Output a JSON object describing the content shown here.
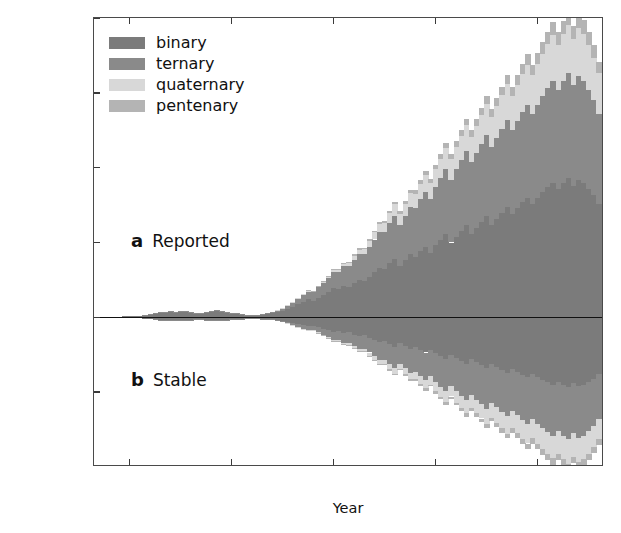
{
  "chart_data": {
    "type": "bar",
    "title": "",
    "xlabel": "Year",
    "ylabel": "# of Structures Discovered in Year",
    "xlim": [
      1913,
      2013
    ],
    "ylim": [
      -1000,
      2000
    ],
    "y_tick_labels": [
      "2000.0",
      "1500.0",
      "1000.0",
      "500.0",
      "0.0",
      "500.0",
      "1000.0"
    ],
    "y_tick_values": [
      2000,
      1500,
      1000,
      500,
      0,
      -500,
      -1000
    ],
    "x_tick_labels": [
      "1920",
      "1940",
      "1960",
      "1980",
      "2000"
    ],
    "x_tick_values": [
      1920,
      1940,
      1960,
      1980,
      2000
    ],
    "grid": false,
    "legend_position": "upper left",
    "stacked": true,
    "mirrored": true,
    "panels": [
      {
        "key": "a",
        "letter": "a",
        "label": "Reported",
        "direction": "up"
      },
      {
        "key": "b",
        "letter": "b",
        "label": "Stable",
        "direction": "down"
      }
    ],
    "legend": [
      {
        "name": "binary",
        "color": "#7b7b7b"
      },
      {
        "name": "ternary",
        "color": "#8a8a8a"
      },
      {
        "name": "quaternary",
        "color": "#d8d8d8"
      },
      {
        "name": "pentenary",
        "color": "#b4b4b4"
      }
    ],
    "series_order": [
      "pentenary",
      "quaternary",
      "ternary",
      "binary"
    ],
    "x": [
      1913,
      1914,
      1915,
      1916,
      1917,
      1918,
      1919,
      1920,
      1921,
      1922,
      1923,
      1924,
      1925,
      1926,
      1927,
      1928,
      1929,
      1930,
      1931,
      1932,
      1933,
      1934,
      1935,
      1936,
      1937,
      1938,
      1939,
      1940,
      1941,
      1942,
      1943,
      1944,
      1945,
      1946,
      1947,
      1948,
      1949,
      1950,
      1951,
      1952,
      1953,
      1954,
      1955,
      1956,
      1957,
      1958,
      1959,
      1960,
      1961,
      1962,
      1963,
      1964,
      1965,
      1966,
      1967,
      1968,
      1969,
      1970,
      1971,
      1972,
      1973,
      1974,
      1975,
      1976,
      1977,
      1978,
      1979,
      1980,
      1981,
      1982,
      1983,
      1984,
      1985,
      1986,
      1987,
      1988,
      1989,
      1990,
      1991,
      1992,
      1993,
      1994,
      1995,
      1996,
      1997,
      1998,
      1999,
      2000,
      2001,
      2002,
      2003,
      2004,
      2005,
      2006,
      2007,
      2008,
      2009,
      2010,
      2011,
      2012
    ],
    "reported": {
      "binary": [
        2,
        3,
        4,
        5,
        4,
        3,
        6,
        8,
        10,
        12,
        16,
        20,
        26,
        34,
        30,
        38,
        34,
        40,
        36,
        32,
        28,
        24,
        30,
        34,
        40,
        36,
        30,
        26,
        22,
        18,
        14,
        10,
        12,
        16,
        20,
        26,
        34,
        44,
        56,
        70,
        86,
        104,
        120,
        112,
        130,
        150,
        170,
        196,
        186,
        210,
        200,
        230,
        250,
        240,
        270,
        300,
        330,
        320,
        360,
        390,
        340,
        380,
        420,
        400,
        440,
        470,
        430,
        480,
        520,
        560,
        500,
        540,
        580,
        620,
        560,
        600,
        640,
        680,
        620,
        660,
        700,
        740,
        690,
        730,
        770,
        800,
        760,
        800,
        840,
        870,
        900,
        860,
        900,
        930,
        880,
        920,
        900,
        860,
        820,
        760
      ],
      "ternary": [
        0,
        0,
        0,
        0,
        0,
        0,
        0,
        0,
        0,
        0,
        1,
        1,
        2,
        2,
        3,
        3,
        4,
        4,
        4,
        4,
        3,
        3,
        4,
        5,
        6,
        6,
        6,
        6,
        5,
        5,
        4,
        4,
        5,
        6,
        8,
        10,
        14,
        18,
        24,
        30,
        38,
        46,
        54,
        60,
        70,
        82,
        94,
        108,
        116,
        130,
        140,
        155,
        170,
        180,
        200,
        220,
        240,
        250,
        270,
        290,
        280,
        300,
        320,
        330,
        350,
        370,
        360,
        390,
        410,
        430,
        420,
        450,
        470,
        490,
        480,
        500,
        520,
        540,
        520,
        540,
        560,
        580,
        560,
        580,
        600,
        620,
        600,
        620,
        640,
        660,
        680,
        660,
        680,
        700,
        670,
        690,
        680,
        660,
        630,
        600
      ],
      "quaternary": [
        0,
        0,
        0,
        0,
        0,
        0,
        0,
        0,
        0,
        0,
        0,
        0,
        0,
        0,
        0,
        0,
        0,
        0,
        0,
        0,
        0,
        0,
        0,
        0,
        0,
        0,
        0,
        0,
        0,
        0,
        0,
        0,
        0,
        0,
        0,
        0,
        1,
        1,
        2,
        2,
        3,
        4,
        5,
        6,
        8,
        10,
        12,
        14,
        16,
        20,
        24,
        28,
        32,
        36,
        42,
        48,
        54,
        58,
        66,
        74,
        72,
        80,
        88,
        94,
        102,
        110,
        108,
        120,
        130,
        140,
        138,
        150,
        160,
        172,
        168,
        180,
        192,
        204,
        200,
        212,
        224,
        236,
        230,
        242,
        254,
        266,
        258,
        270,
        282,
        294,
        306,
        300,
        312,
        324,
        310,
        320,
        315,
        300,
        285,
        270
      ],
      "pentenary": [
        0,
        0,
        0,
        0,
        0,
        0,
        0,
        0,
        0,
        0,
        0,
        0,
        0,
        0,
        0,
        0,
        0,
        0,
        0,
        0,
        0,
        0,
        0,
        0,
        0,
        0,
        0,
        0,
        0,
        0,
        0,
        0,
        0,
        0,
        0,
        0,
        0,
        0,
        0,
        0,
        0,
        0,
        1,
        1,
        2,
        2,
        3,
        4,
        4,
        5,
        6,
        7,
        8,
        9,
        10,
        12,
        14,
        15,
        17,
        19,
        18,
        20,
        22,
        24,
        26,
        28,
        27,
        30,
        33,
        36,
        35,
        38,
        41,
        44,
        43,
        46,
        49,
        52,
        50,
        54,
        58,
        62,
        60,
        64,
        68,
        72,
        70,
        74,
        78,
        82,
        86,
        84,
        88,
        92,
        88,
        92,
        90,
        86,
        82,
        78
      ]
    },
    "stable": {
      "binary": [
        1,
        2,
        2,
        3,
        2,
        2,
        3,
        4,
        5,
        6,
        8,
        10,
        13,
        17,
        15,
        19,
        17,
        20,
        18,
        16,
        14,
        12,
        15,
        17,
        20,
        18,
        15,
        13,
        11,
        9,
        7,
        5,
        6,
        8,
        10,
        13,
        17,
        22,
        28,
        35,
        43,
        52,
        60,
        56,
        65,
        75,
        85,
        98,
        93,
        105,
        100,
        115,
        125,
        120,
        135,
        150,
        165,
        160,
        180,
        195,
        170,
        190,
        210,
        200,
        220,
        235,
        215,
        240,
        260,
        280,
        250,
        270,
        290,
        310,
        280,
        300,
        320,
        340,
        310,
        330,
        350,
        370,
        345,
        365,
        385,
        400,
        380,
        400,
        420,
        435,
        450,
        430,
        450,
        465,
        440,
        460,
        450,
        430,
        410,
        380
      ],
      "ternary": [
        0,
        0,
        0,
        0,
        0,
        0,
        0,
        0,
        0,
        0,
        0,
        0,
        1,
        1,
        1,
        1,
        2,
        2,
        2,
        2,
        1,
        1,
        2,
        2,
        3,
        3,
        3,
        3,
        2,
        2,
        2,
        2,
        2,
        3,
        4,
        5,
        7,
        9,
        12,
        15,
        19,
        23,
        27,
        30,
        35,
        41,
        47,
        54,
        58,
        65,
        70,
        78,
        85,
        90,
        100,
        110,
        120,
        125,
        135,
        145,
        140,
        150,
        160,
        165,
        175,
        185,
        180,
        195,
        205,
        215,
        210,
        225,
        235,
        245,
        240,
        250,
        260,
        270,
        260,
        270,
        280,
        290,
        280,
        290,
        300,
        310,
        300,
        310,
        320,
        330,
        340,
        330,
        340,
        350,
        335,
        345,
        340,
        330,
        315,
        300
      ],
      "quaternary": [
        0,
        0,
        0,
        0,
        0,
        0,
        0,
        0,
        0,
        0,
        0,
        0,
        0,
        0,
        0,
        0,
        0,
        0,
        0,
        0,
        0,
        0,
        0,
        0,
        0,
        0,
        0,
        0,
        0,
        0,
        0,
        0,
        0,
        0,
        0,
        0,
        0,
        0,
        1,
        1,
        1,
        2,
        2,
        3,
        4,
        5,
        6,
        7,
        8,
        10,
        12,
        14,
        16,
        18,
        21,
        24,
        27,
        29,
        33,
        37,
        36,
        40,
        44,
        47,
        51,
        55,
        54,
        60,
        65,
        70,
        69,
        75,
        80,
        86,
        84,
        90,
        96,
        102,
        100,
        106,
        112,
        118,
        115,
        121,
        127,
        133,
        129,
        135,
        141,
        147,
        153,
        150,
        156,
        162,
        155,
        160,
        157,
        150,
        142,
        135
      ],
      "pentenary": [
        0,
        0,
        0,
        0,
        0,
        0,
        0,
        0,
        0,
        0,
        0,
        0,
        0,
        0,
        0,
        0,
        0,
        0,
        0,
        0,
        0,
        0,
        0,
        0,
        0,
        0,
        0,
        0,
        0,
        0,
        0,
        0,
        0,
        0,
        0,
        0,
        0,
        0,
        0,
        0,
        0,
        0,
        0,
        0,
        1,
        1,
        1,
        2,
        2,
        2,
        3,
        3,
        4,
        4,
        5,
        6,
        7,
        7,
        8,
        9,
        9,
        10,
        11,
        12,
        13,
        14,
        13,
        15,
        16,
        18,
        17,
        19,
        20,
        22,
        21,
        23,
        24,
        26,
        25,
        27,
        29,
        31,
        30,
        32,
        34,
        36,
        35,
        37,
        39,
        41,
        43,
        42,
        44,
        46,
        44,
        46,
        45,
        43,
        41,
        39
      ]
    },
    "annotations": [
      {
        "text": "2003 reported spike",
        "x": 2003,
        "y": 1560
      }
    ]
  },
  "axis": {
    "ylabel": "# of Structures Discovered in Year",
    "xlabel": "Year"
  }
}
